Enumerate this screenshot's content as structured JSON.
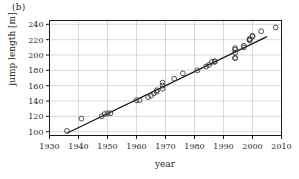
{
  "figure": {
    "panel_label": "(b)",
    "xlabel": "year",
    "ylabel": "jump length [m]"
  },
  "style": {
    "axis_color": "#1a1a1a",
    "grid_color": "#c8c8c8",
    "marker_color": "#3a3a3a",
    "line_color": "#111111",
    "background": "#ffffff"
  },
  "chart_data": {
    "type": "scatter",
    "title": "",
    "subtitle": "",
    "xlabel": "year",
    "ylabel": "jump length [m]",
    "xlim": [
      1930,
      2010
    ],
    "ylim": [
      95,
      245
    ],
    "xticks": [
      1930,
      1940,
      1950,
      1960,
      1970,
      1980,
      1990,
      2000,
      2010
    ],
    "yticks": [
      100,
      120,
      140,
      160,
      180,
      200,
      220,
      240
    ],
    "xtick_labels": [
      "1930",
      "1940",
      "1950",
      "1960",
      "1970",
      "1980",
      "1990",
      "2000",
      "2010"
    ],
    "ytick_labels": [
      "100",
      "120",
      "140",
      "160",
      "180",
      "200",
      "220",
      "240"
    ],
    "grid": true,
    "legend": "none",
    "marker": "open-circle",
    "series": [
      {
        "name": "world record jump length",
        "marker": "open-circle",
        "x": [
          1936,
          1941,
          1948,
          1949,
          1950,
          1951,
          1960,
          1961,
          1964,
          1965,
          1966,
          1967,
          1967,
          1969,
          1969,
          1969,
          1973,
          1976,
          1981,
          1984,
          1985,
          1986,
          1987,
          1987,
          1994,
          1994,
          1994,
          1994,
          1994,
          1997,
          1997,
          1999,
          1999,
          1999,
          2000,
          2000,
          2003,
          2008
        ],
        "y": [
          101,
          117,
          120,
          123,
          124,
          124,
          141,
          141,
          145,
          147,
          150,
          152,
          154,
          156,
          160,
          164,
          169,
          176,
          180,
          185,
          187,
          191,
          191,
          192,
          196,
          203,
          207,
          209,
          196,
          210,
          212,
          219,
          220,
          221,
          224,
          225,
          231,
          236
        ]
      },
      {
        "name": "linear fit",
        "type": "line",
        "x": [
          1936,
          2005
        ],
        "y": [
          98,
          224
        ]
      }
    ]
  }
}
